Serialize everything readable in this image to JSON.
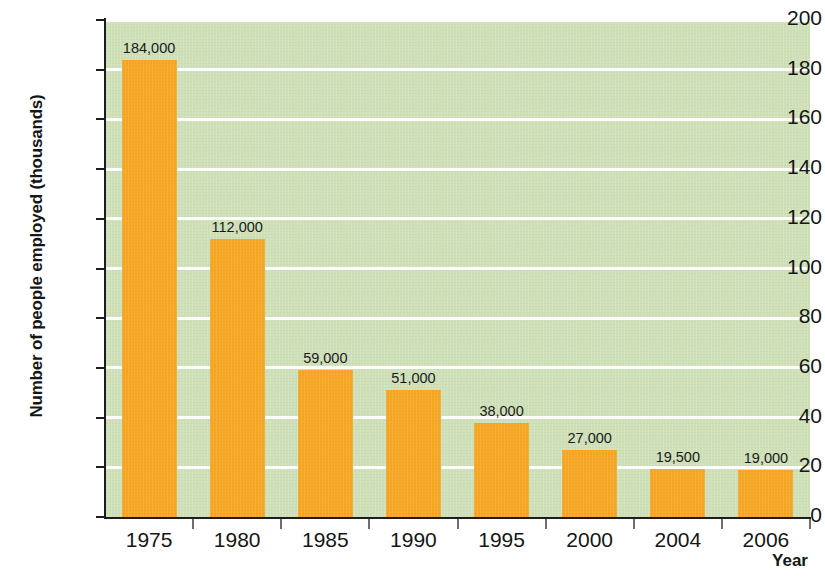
{
  "chart_data": {
    "type": "bar",
    "title": "",
    "xlabel": "Year",
    "ylabel": "Number of people employed (thousands)",
    "categories": [
      "1975",
      "1980",
      "1985",
      "1990",
      "1995",
      "2000",
      "2004",
      "2006"
    ],
    "values": [
      184,
      112,
      59,
      51,
      38,
      27,
      19.5,
      19
    ],
    "value_labels": [
      "184,000",
      "112,000",
      "59,000",
      "51,000",
      "38,000",
      "27,000",
      "19,500",
      "19,000"
    ],
    "ylim": [
      0,
      200
    ],
    "ytick_labels": [
      "0",
      "20",
      "40",
      "60",
      "80",
      "100",
      "120",
      "140",
      "160",
      "180",
      "200"
    ],
    "ytick_values": [
      0,
      20,
      40,
      60,
      80,
      100,
      120,
      140,
      160,
      180,
      200
    ],
    "grid": true,
    "grid_color": "#ffffff",
    "legend": "none",
    "bar_color": "#f5a623",
    "plot_background": "#cfe0b8",
    "page_background": "#ffffff",
    "axis_color": "#1d1d1d",
    "text_color": "#161616"
  }
}
